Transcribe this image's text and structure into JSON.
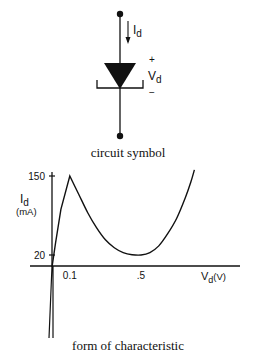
{
  "symbol": {
    "current_label": "I",
    "current_sub": "d",
    "plus_label": "+",
    "voltage_label": "V",
    "voltage_sub": "d",
    "minus_label": "−",
    "caption": "circuit symbol"
  },
  "chart_data": {
    "type": "line",
    "title": "form of characteristic",
    "xlabel": "V",
    "xlabel_sub": "d",
    "xlabel_unit": "(V)",
    "ylabel": "I",
    "ylabel_sub": "d",
    "ylabel_unit": "(mA)",
    "x_ticks": [
      {
        "value": 0.1,
        "label": "0.1"
      },
      {
        "value": 0.5,
        "label": ".5"
      }
    ],
    "y_ticks": [
      {
        "value": 150,
        "label": "150"
      },
      {
        "value": 20,
        "label": "20"
      }
    ],
    "xlim": [
      -0.02,
      0.85
    ],
    "ylim": [
      -70,
      160
    ],
    "series": [
      {
        "name": "tunnel diode characteristic",
        "points": [
          [
            -0.005,
            -70
          ],
          [
            -0.002,
            -30
          ],
          [
            0.0,
            0
          ],
          [
            0.02,
            40
          ],
          [
            0.05,
            95
          ],
          [
            0.1,
            150
          ],
          [
            0.15,
            120
          ],
          [
            0.2,
            90
          ],
          [
            0.25,
            65
          ],
          [
            0.3,
            45
          ],
          [
            0.35,
            32
          ],
          [
            0.4,
            24
          ],
          [
            0.45,
            20.5
          ],
          [
            0.5,
            20
          ],
          [
            0.55,
            24
          ],
          [
            0.6,
            35
          ],
          [
            0.65,
            55
          ],
          [
            0.7,
            80
          ],
          [
            0.75,
            115
          ],
          [
            0.78,
            140
          ],
          [
            0.8,
            160
          ]
        ]
      }
    ],
    "grid": false
  }
}
